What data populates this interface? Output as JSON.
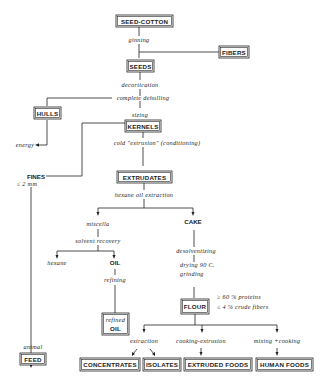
{
  "diagram": {
    "nodes": {
      "seed_cotton": "SEED-COTTON",
      "fibers": "FIBERS",
      "seeds": "SEEDS",
      "hulls": "HULLS",
      "kernels": "KERNELS",
      "fines": "FINES",
      "extrudates": "EXTRUDATES",
      "cake": "CAKE",
      "oil": "OIL",
      "refined_oil_line1": "refined",
      "refined_oil_line2": "OIL",
      "flour": "FLOUR",
      "feed": "FEED",
      "concentrates": "CONCENTRATES",
      "isolates": "ISOLATES",
      "extruded_foods": "EXTRUDED FOODS",
      "human_foods": "HUMAN FOODS"
    },
    "processes": {
      "ginning": "ginning",
      "decortication": "decortication",
      "complete_dehulling": "complete dehulling",
      "sizing": "sizing",
      "energy": "energy",
      "fines_size": "≤ 2 mm",
      "cold_extrusion": "cold \"extrusion\" (conditioning)",
      "hexane_oil_extraction": "hexane oil extraction",
      "miscella": "miscella",
      "solvent_recovery": "solvent recovery",
      "hexane": "hexane",
      "refining": "refining",
      "desolventizing": "desolventizing",
      "drying": "drying  90 C.",
      "grinding": "grinding",
      "protein_spec": "≥ 60 % proteins",
      "fiber_spec": "≤ 4 % crude fibers",
      "animal": "animal",
      "extraction": "extraction",
      "cooking_extrusion": "cooking-extrusion",
      "mixing_cooking": "mixing +cooking"
    }
  }
}
